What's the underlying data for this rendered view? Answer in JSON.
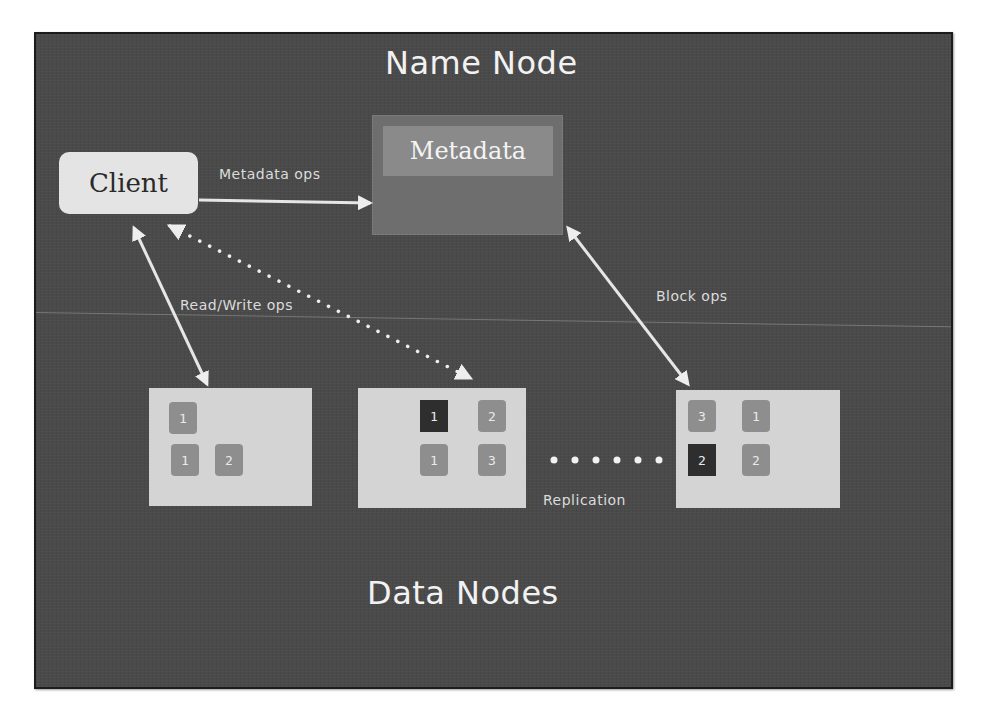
{
  "diagram": {
    "title_top": "Name Node",
    "title_bottom": "Data Nodes",
    "client": {
      "label": "Client"
    },
    "namenode": {
      "metadata_label": "Metadata"
    },
    "edges": [
      {
        "from": "client",
        "to": "namenode",
        "label": "Metadata ops",
        "style": "solid",
        "direction": "one-way"
      },
      {
        "from": "client",
        "to": "datanode-1",
        "label": "Read/Write ops",
        "style": "solid",
        "direction": "two-way"
      },
      {
        "from": "client",
        "to": "datanode-2",
        "label": "",
        "style": "dotted",
        "direction": "two-way"
      },
      {
        "from": "namenode",
        "to": "datanode-3",
        "label": "Block ops",
        "style": "solid",
        "direction": "two-way"
      }
    ],
    "labels": {
      "metadata_ops": "Metadata ops",
      "read_write_ops": "Read/Write ops",
      "block_ops": "Block ops",
      "replication": "Replication"
    },
    "datanodes": [
      {
        "id": "datanode-1",
        "blocks": [
          {
            "label": "1",
            "shade": "mid"
          },
          {
            "label": "1",
            "shade": "mid"
          },
          {
            "label": "2",
            "shade": "mid"
          }
        ]
      },
      {
        "id": "datanode-2",
        "blocks": [
          {
            "label": "1",
            "shade": "dark"
          },
          {
            "label": "2",
            "shade": "mid"
          },
          {
            "label": "1",
            "shade": "mid"
          },
          {
            "label": "3",
            "shade": "mid"
          }
        ]
      },
      {
        "id": "datanode-3",
        "blocks": [
          {
            "label": "3",
            "shade": "mid"
          },
          {
            "label": "1",
            "shade": "mid"
          },
          {
            "label": "2",
            "shade": "dark"
          },
          {
            "label": "2",
            "shade": "mid"
          }
        ]
      }
    ],
    "colors": {
      "board": "#4a4a4a",
      "chalk": "#f2f2f2",
      "client_box": "#e4e4e4",
      "metadata_outer": "#6e6e6e",
      "metadata_inner": "#8a8a8a",
      "datanode_box": "#d4d4d4",
      "block_mid": "#8e8e8e",
      "block_dark": "#2e2e2e"
    }
  }
}
